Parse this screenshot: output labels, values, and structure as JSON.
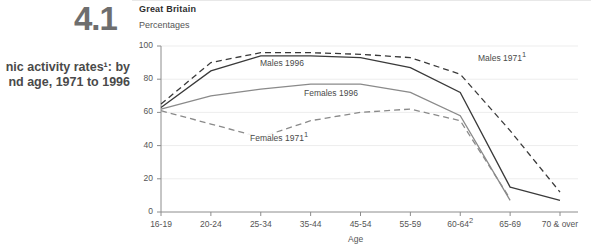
{
  "figure": {
    "number": "4.1",
    "title_lines": [
      "nic activity rates¹: by",
      "nd age, 1971 to 1996"
    ],
    "title_full": "Economic activity rates¹: by gender and age, 1971 to 1996",
    "geography": "Great Britain",
    "units": "Percentages"
  },
  "chart_data": {
    "type": "line",
    "subtitle": "Great Britain",
    "xlabel": "Age",
    "ylabel": "Percentages",
    "ylim": [
      0,
      100
    ],
    "yticks": [
      0,
      20,
      40,
      60,
      80,
      100
    ],
    "grid": true,
    "legend": "inline-labels",
    "categories": [
      "16-19",
      "20-24",
      "25-34",
      "35-44",
      "45-54",
      "55-59",
      "60-64²",
      "65-69",
      "70 & over"
    ],
    "category_labels": {
      "0": "16-19",
      "1": "20-24",
      "2": "25-34",
      "3": "35-44",
      "4": "45-54",
      "5": "55-59",
      "6": "60-64²",
      "7": "65-69",
      "8": "70 & over"
    },
    "series": [
      {
        "name": "Males 1971¹",
        "label": "Males 1971¹",
        "style": "dashed",
        "color": "#3a3a3a",
        "values": [
          65,
          90,
          96,
          96,
          95,
          93,
          83,
          49,
          12
        ]
      },
      {
        "name": "Males 1996",
        "label": "Males 1996",
        "style": "solid",
        "color": "#3a3a3a",
        "values": [
          63,
          85,
          94,
          94,
          93,
          87,
          72,
          15,
          7
        ]
      },
      {
        "name": "Females 1996",
        "label": "Females 1996",
        "style": "solid",
        "color": "#8a8a8a",
        "values": [
          62,
          70,
          74,
          77,
          77,
          72,
          58,
          7,
          null
        ]
      },
      {
        "name": "Females 1971¹",
        "label": "Females 1971¹",
        "style": "dashed",
        "color": "#8a8a8a",
        "values": [
          61,
          53,
          45,
          55,
          60,
          62,
          55,
          8,
          null
        ]
      }
    ],
    "annotations": [
      {
        "text": "Males 1996",
        "x_category": "25-34"
      },
      {
        "text": "Females 1996",
        "x_category": "35-44"
      },
      {
        "text": "Females 1971¹",
        "x_category": "25-34"
      },
      {
        "text": "Males 1971¹",
        "x_category": "60-64²"
      }
    ]
  },
  "colors": {
    "dark_series": "#3a3a3a",
    "light_series": "#8a8a8a",
    "grid": "#ededed",
    "axis": "#8c8c8c",
    "text": "#555555",
    "fig_number": "#6e6e6e"
  }
}
